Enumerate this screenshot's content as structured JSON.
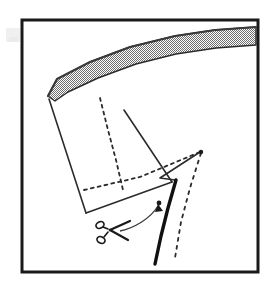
{
  "figure": {
    "kind": "instructional-line-drawing",
    "title": "Cutting diagram with scissors and fold lines",
    "caption": "",
    "background_color": "#ffffff"
  },
  "frame": {
    "name": "figure-border",
    "x": 22,
    "y": 20,
    "width": 236,
    "height": 252,
    "stroke_color": "#1a1a1a",
    "stroke_width": 3,
    "fill": "none"
  },
  "smudge": {
    "name": "scan-artifact",
    "x": 6,
    "y": 28,
    "width": 14,
    "height": 14,
    "color": "#e4e4e4",
    "opacity": 0.55
  },
  "hatched_band": {
    "name": "hatched-curved-band",
    "description": "curved shaded band across the top, dotted/checkered fill",
    "fill_color": "#a8a8a8",
    "pattern": "checker-dither",
    "pattern_size": 2,
    "stroke_color": "#2b2b2b",
    "stroke_width": 1.4,
    "outline_points": "48,96 57,79 90,62 130,47 175,36 215,30 256,27 256,45 216,48 176,54 136,64 98,78 68,92 55,101",
    "top_edge_color": "#3a3a3a",
    "top_edge_width": 2.2,
    "top_edge_points": "48,96 57,79 90,62 130,47 175,36 215,30 256,27"
  },
  "panel": {
    "name": "main-panel-outline",
    "description": "solid quadrilateral panel below the hatched band",
    "stroke_color": "#2b2b2b",
    "stroke_width": 1.6,
    "fill": "none",
    "points": "48,97 57,102 86,213 174,181 167,169 121,137 92,116 55,100"
  },
  "panel_edges": [
    {
      "name": "panel-left-edge",
      "points": "49,99 86,213",
      "stroke_color": "#2b2b2b",
      "stroke_width": 1.6
    },
    {
      "name": "panel-bottom-edge",
      "points": "86,213 172,182",
      "stroke_color": "#2b2b2b",
      "stroke_width": 1.6
    },
    {
      "name": "panel-upper-right-edge",
      "points": "124,110 172,182",
      "stroke_color": "#2b2b2b",
      "stroke_width": 1.6
    }
  ],
  "dashed_lines": [
    {
      "name": "fold-line-vertical",
      "description": "dashed fold line running down from the band to the cross point",
      "points": "100,98 108,130 116,160 123,190",
      "stroke_color": "#2b2b2b",
      "stroke_width": 1.8,
      "dash": "3 4"
    },
    {
      "name": "fold-line-horizontal",
      "description": "dashed seam line sloping up to the right vertex",
      "points": "84,190 140,177 200,152",
      "stroke_color": "#2b2b2b",
      "stroke_width": 1.8,
      "dash": "3 4"
    },
    {
      "name": "flap-dashed-diagonal",
      "description": "dashed edge of the folded-out triangular flap",
      "points": "201,153 190,188 181,222 175,258",
      "stroke_color": "#2b2b2b",
      "stroke_width": 1.8,
      "dash": "3 5"
    }
  ],
  "flap": {
    "name": "triangular-flap",
    "description": "solid triangular flap outline on the right",
    "stroke_color": "#2b2b2b",
    "stroke_width": 1.6,
    "points": "200,152 160,178 175,180",
    "vertex_dot": {
      "name": "flap-vertex-dot",
      "cx": 201,
      "cy": 152,
      "r": 2.2,
      "color": "#1a1a1a"
    }
  },
  "cut_line": {
    "name": "thick-cut-line",
    "description": "heavy solid line indicating where to cut",
    "points": "176,180 168,208 161,236 155,264",
    "stroke_color": "#111111",
    "stroke_width": 3.4
  },
  "arrow": {
    "name": "cut-direction-arrow",
    "description": "curved arrow from the scissors toward the cut line",
    "stroke_color": "#3a3a3a",
    "stroke_width": 1.3,
    "path": "M 120,231 C 134,228 150,219 158,206",
    "head": {
      "name": "arrow-head",
      "points": "158,204 155,212 163,211",
      "color": "#1a1a1a"
    },
    "tail_dot": {
      "name": "arrow-tail-dot",
      "cx": 159,
      "cy": 203,
      "r": 2.4,
      "color": "#1a1a1a"
    }
  },
  "scissors": {
    "name": "scissors-icon",
    "description": "scissors symbol marking the cut",
    "color": "#1a1a1a",
    "stroke_width": 1.5,
    "pivot": {
      "cx": 110,
      "cy": 230
    },
    "blades": [
      {
        "name": "scissors-blade-upper",
        "points": "110,230 130,221"
      },
      {
        "name": "scissors-blade-lower",
        "points": "110,230 128,240"
      }
    ],
    "handles": [
      {
        "name": "scissors-handle-upper",
        "cx": 100,
        "cy": 225,
        "rx": 4.2,
        "ry": 3.2,
        "rot": -28
      },
      {
        "name": "scissors-handle-lower",
        "cx": 101,
        "cy": 240,
        "rx": 4.2,
        "ry": 3.2,
        "rot": 28
      }
    ],
    "legs": [
      {
        "name": "scissors-leg-upper",
        "points": "108,229 103,227"
      },
      {
        "name": "scissors-leg-lower",
        "points": "108,232 104,237"
      }
    ]
  }
}
